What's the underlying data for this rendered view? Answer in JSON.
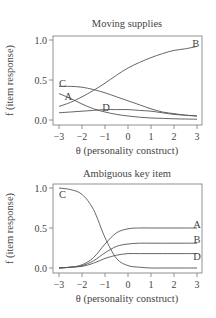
{
  "chart_data": [
    {
      "type": "line",
      "title": "Moving supplies",
      "xlabel": "θ (personality construct)",
      "ylabel": "f (item response)",
      "xlim": [
        -3,
        3
      ],
      "ylim": [
        0,
        1
      ],
      "xticks": [
        "−3",
        "−2",
        "−1",
        "0",
        "1",
        "2",
        "3"
      ],
      "yticks": [
        "0.0",
        "0.5",
        "1.0"
      ],
      "grid": false,
      "x": [
        -3,
        -2.5,
        -2,
        -1.5,
        -1,
        -0.5,
        0,
        0.5,
        1,
        1.5,
        2,
        2.5,
        3
      ],
      "series": [
        {
          "name": "A",
          "values": [
            0.33,
            0.27,
            0.2,
            0.14,
            0.1,
            0.07,
            0.05,
            0.035,
            0.025,
            0.02,
            0.015,
            0.012,
            0.01
          ]
        },
        {
          "name": "B",
          "values": [
            0.17,
            0.22,
            0.29,
            0.37,
            0.46,
            0.56,
            0.65,
            0.72,
            0.78,
            0.83,
            0.87,
            0.89,
            0.92
          ]
        },
        {
          "name": "C",
          "values": [
            0.42,
            0.42,
            0.41,
            0.38,
            0.34,
            0.29,
            0.24,
            0.19,
            0.14,
            0.1,
            0.08,
            0.06,
            0.05
          ]
        },
        {
          "name": "D",
          "values": [
            0.09,
            0.1,
            0.11,
            0.12,
            0.13,
            0.13,
            0.13,
            0.12,
            0.11,
            0.09,
            0.07,
            0.06,
            0.05
          ]
        }
      ],
      "annotations": [
        {
          "text": "A",
          "x": -2.6,
          "y": 0.29
        },
        {
          "text": "B",
          "x": 2.95,
          "y": 0.96
        },
        {
          "text": "C",
          "x": -2.85,
          "y": 0.46
        },
        {
          "text": "D",
          "x": -0.95,
          "y": 0.16
        }
      ]
    },
    {
      "type": "line",
      "title": "Ambiguous key item",
      "xlabel": "θ (personality construct)",
      "ylabel": "f (item response)",
      "xlim": [
        -3,
        3
      ],
      "ylim": [
        0,
        1
      ],
      "xticks": [
        "−3",
        "−2",
        "−1",
        "0",
        "1",
        "2",
        "3"
      ],
      "yticks": [
        "0.0",
        "0.5",
        "1.0"
      ],
      "grid": false,
      "x": [
        -3,
        -2.5,
        -2,
        -1.5,
        -1,
        -0.5,
        0,
        0.5,
        1,
        1.5,
        2,
        2.5,
        3
      ],
      "series": [
        {
          "name": "A",
          "values": [
            0.0,
            0.01,
            0.04,
            0.13,
            0.3,
            0.44,
            0.49,
            0.5,
            0.5,
            0.5,
            0.5,
            0.5,
            0.5
          ]
        },
        {
          "name": "B",
          "values": [
            0.0,
            0.01,
            0.03,
            0.09,
            0.19,
            0.27,
            0.3,
            0.31,
            0.31,
            0.31,
            0.31,
            0.31,
            0.31
          ]
        },
        {
          "name": "C",
          "values": [
            1.0,
            0.98,
            0.92,
            0.73,
            0.38,
            0.12,
            0.03,
            0.01,
            0.0,
            0.0,
            0.0,
            0.0,
            0.0
          ]
        },
        {
          "name": "D",
          "values": [
            0.0,
            0.01,
            0.02,
            0.06,
            0.12,
            0.16,
            0.18,
            0.18,
            0.18,
            0.18,
            0.18,
            0.18,
            0.18
          ]
        }
      ],
      "annotations": [
        {
          "text": "A",
          "x": 3.0,
          "y": 0.55
        },
        {
          "text": "B",
          "x": 3.0,
          "y": 0.36
        },
        {
          "text": "C",
          "x": -2.85,
          "y": 0.92
        },
        {
          "text": "D",
          "x": 3.0,
          "y": 0.14
        }
      ]
    }
  ]
}
